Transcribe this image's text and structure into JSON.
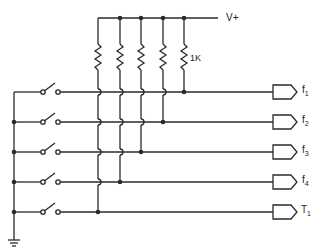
{
  "diagram": {
    "type": "circuit-schematic",
    "supply_label": "V+",
    "resistor_label": "1K",
    "ground_label": "ground",
    "colors": {
      "line": "#2a2a2a",
      "background": "#ffffff"
    },
    "outputs": [
      {
        "name": "f",
        "sub": "1"
      },
      {
        "name": "f",
        "sub": "2"
      },
      {
        "name": "f",
        "sub": "3"
      },
      {
        "name": "f",
        "sub": "4"
      },
      {
        "name": "T",
        "sub": "1"
      }
    ],
    "switch_count": 5,
    "resistor_count": 5
  }
}
